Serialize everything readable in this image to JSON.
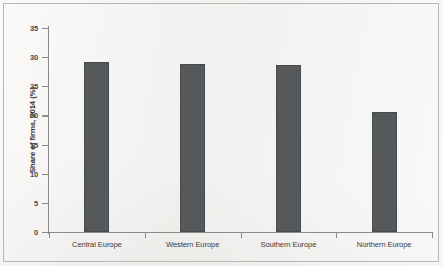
{
  "chart_data": {
    "type": "bar",
    "title": "",
    "subtitle": "",
    "xlabel": "",
    "ylabel": "Share of firms, 2014 (%)",
    "categories": [
      "Central Europe",
      "Western Europe",
      "Southern Europe",
      "Northern Europe"
    ],
    "values": [
      29.2,
      28.8,
      28.7,
      20.6
    ],
    "ylim": [
      0,
      35
    ],
    "ytick_labels": [
      "35",
      "30",
      "25",
      "20",
      "15",
      "10",
      "5",
      "0"
    ],
    "ytick_values": [
      35,
      30,
      25,
      20,
      15,
      10,
      5,
      0
    ],
    "grid": false,
    "legend": null,
    "legend_position": "none",
    "bar_color": "#55595b",
    "axis_color": "#8b8b89",
    "background_color": "#f4f3f1",
    "annotations": []
  }
}
